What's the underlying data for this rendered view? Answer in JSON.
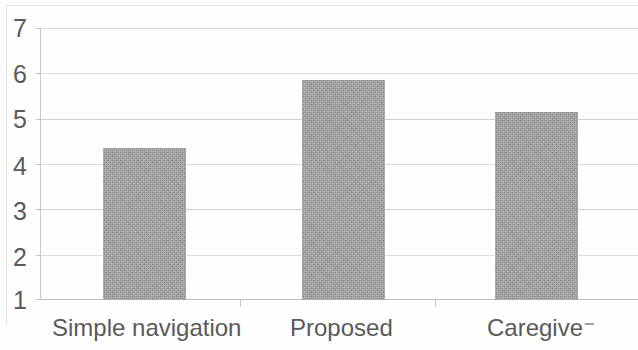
{
  "chart_data": {
    "type": "bar",
    "title": "",
    "subtitle": "",
    "xlabel": "",
    "ylabel": "",
    "categories": [
      "Simple navigation",
      "Proposed",
      "Caregive⁻"
    ],
    "values": [
      4.35,
      5.85,
      5.15
    ],
    "series": [
      {
        "name": "",
        "values": [
          4.35,
          5.85,
          5.15
        ]
      }
    ],
    "ylim": [
      1,
      7
    ],
    "y_ticks": [
      1,
      2,
      3,
      4,
      5,
      6,
      7
    ],
    "y_tick_labels": [
      "1",
      "2",
      "3",
      "4",
      "5",
      "6",
      "7"
    ],
    "grid": true,
    "legend": false,
    "legend_position": "none",
    "bar_color": "#9e9e9e",
    "gridline_color": "#dcdcdc",
    "axis_color": "#c2c2c2",
    "text_color": "#5a5a5a",
    "background": "#fefefe"
  },
  "axis": {
    "y_labels": [
      "7",
      "6",
      "5",
      "4",
      "3",
      "2",
      "1"
    ]
  }
}
